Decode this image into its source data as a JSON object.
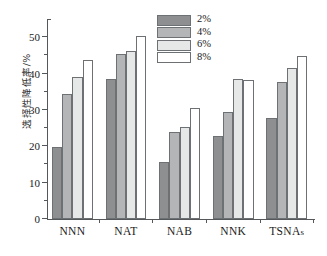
{
  "chart_data": {
    "type": "bar",
    "title": "",
    "xlabel": "",
    "ylabel": "选择性降低率/%",
    "categories": [
      "NNN",
      "NAT",
      "NAB",
      "NNK",
      "TSNAs"
    ],
    "ylim": [
      0,
      55
    ],
    "yticks": [
      0,
      10,
      20,
      30,
      40,
      50
    ],
    "ytick_labels": [
      "0",
      "10",
      "20",
      "30",
      "40",
      "50"
    ],
    "yminor_step": 5,
    "grid": false,
    "legend_position": "top-center",
    "series": [
      {
        "name": "2%",
        "color": "#8d8f91",
        "values": [
          19.8,
          38.5,
          15.6,
          22.8,
          27.8
        ]
      },
      {
        "name": "4%",
        "color": "#b3b5b6",
        "values": [
          34.4,
          45.5,
          23.8,
          29.4,
          37.6
        ]
      },
      {
        "name": "6%",
        "color": "#e6e7e7",
        "values": [
          39.1,
          46.3,
          25.4,
          38.6,
          41.5
        ]
      },
      {
        "name": "8%",
        "color": "#ffffff",
        "values": [
          43.7,
          50.2,
          30.6,
          38.2,
          44.9
        ]
      }
    ]
  },
  "legend": {
    "items": [
      {
        "label": "2%",
        "color": "#8d8f91"
      },
      {
        "label": "4%",
        "color": "#b3b5b6"
      },
      {
        "label": "6%",
        "color": "#e6e7e7"
      },
      {
        "label": "8%",
        "color": "#ffffff"
      }
    ]
  },
  "axes": {
    "y_axis_title": "选择性降低率/%"
  },
  "caption": {
    "text": ""
  }
}
